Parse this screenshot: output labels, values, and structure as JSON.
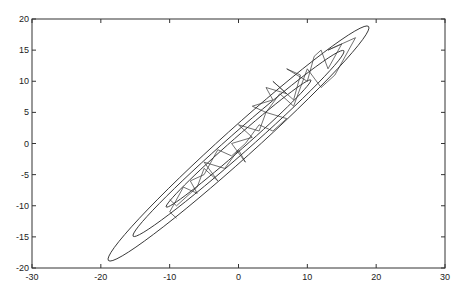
{
  "chart_data": {
    "type": "line",
    "title": "",
    "xlabel": "",
    "ylabel": "",
    "xlim": [
      -30,
      30
    ],
    "ylim": [
      -20,
      20
    ],
    "xticks": [
      -30,
      -20,
      -10,
      0,
      10,
      20,
      30
    ],
    "yticks": [
      -20,
      -15,
      -10,
      -5,
      0,
      5,
      10,
      15,
      20
    ],
    "grid": false,
    "legend": null,
    "line_color": "#333333",
    "contours": [
      {
        "name": "outer",
        "center": [
          0,
          0
        ],
        "tip": [
          18.9,
          18.8
        ],
        "half_width": 2.2
      },
      {
        "name": "middle",
        "center": [
          0,
          0
        ],
        "tip": [
          15.3,
          14.9
        ],
        "half_width": 1.5
      },
      {
        "name": "inner",
        "center": [
          0,
          0
        ],
        "tip": [
          10.5,
          10.2
        ],
        "half_width": 0.9
      }
    ],
    "series": [
      {
        "name": "sampler-path",
        "x": [
          -10,
          -9,
          -6,
          -5,
          -3,
          -5,
          -2,
          0,
          1,
          -1,
          2,
          0,
          3,
          4,
          2,
          5,
          4,
          7,
          5,
          8,
          9,
          7,
          10,
          11,
          12,
          13,
          15,
          13,
          17,
          14,
          12,
          10,
          8,
          6,
          4,
          7,
          5,
          3,
          1,
          -1,
          -3,
          -5,
          -7,
          -6,
          -8,
          -10,
          -9
        ],
        "y": [
          -9,
          -10,
          -7,
          -4,
          -6,
          -3,
          -4,
          -1,
          -3,
          0,
          1,
          3,
          2,
          5,
          6,
          7,
          9,
          8,
          10,
          7,
          11,
          12,
          10,
          14,
          15,
          12,
          16,
          15,
          17,
          11,
          9,
          12,
          6,
          8,
          5,
          4,
          2,
          3,
          0,
          -2,
          -1,
          -5,
          -6,
          -8,
          -7,
          -11,
          -12
        ]
      }
    ]
  }
}
